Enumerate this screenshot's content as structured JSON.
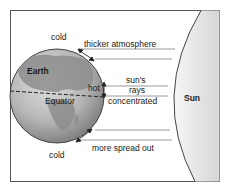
{
  "diagram": {
    "labels": {
      "cold_top": "cold",
      "cold_bottom": "cold",
      "thicker_atmosphere": "thicker atmosphere",
      "earth": "Earth",
      "equator": "Equator",
      "hot": "hot",
      "suns_rays_line1": "sun's",
      "suns_rays_line2": "rays",
      "suns_rays_line3": "concentrated",
      "sun": "Sun",
      "more_spread_out": "more spread out"
    },
    "colors": {
      "border": "#555555",
      "earth_ocean": "#b8b8b8",
      "earth_land": "#8c8c8c",
      "sun_fill": "#ececec",
      "ray_line": "#9a9a9a",
      "text": "#1a1a1a"
    }
  }
}
